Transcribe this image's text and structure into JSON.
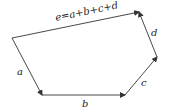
{
  "diagram": {
    "type": "vector-polygon",
    "vectors": [
      {
        "id": "a",
        "label": "a",
        "from": [
          12,
          38
        ],
        "to": [
          42,
          95
        ]
      },
      {
        "id": "b",
        "label": "b",
        "from": [
          42,
          95
        ],
        "to": [
          125,
          95
        ]
      },
      {
        "id": "c",
        "label": "c",
        "from": [
          125,
          95
        ],
        "to": [
          157,
          57
        ]
      },
      {
        "id": "d",
        "label": "d",
        "from": [
          157,
          57
        ],
        "to": [
          139,
          12
        ]
      },
      {
        "id": "e",
        "label": "e=a+b+c+d",
        "from": [
          12,
          38
        ],
        "to": [
          139,
          12
        ]
      }
    ],
    "labels": {
      "a": "a",
      "b": "b",
      "c": "c",
      "d": "d",
      "e": "e=a+b+c+d"
    },
    "colors": {
      "line": "#333333",
      "text": "#222222",
      "background": "#ffffff"
    }
  }
}
